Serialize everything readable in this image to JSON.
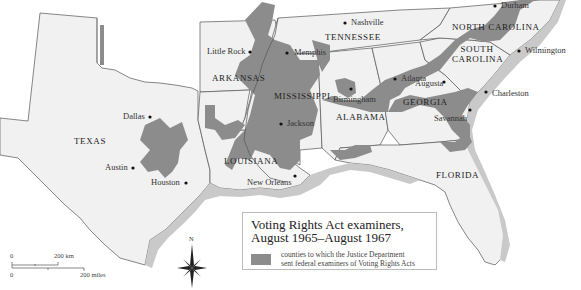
{
  "map": {
    "title": "Voting Rights Act examiners, August 1965–August 1967",
    "states": [
      {
        "name": "TEXAS",
        "x": 87,
        "y": 141
      },
      {
        "name": "ARKANSAS",
        "x": 214,
        "y": 78
      },
      {
        "name": "LOUISIANA",
        "x": 229,
        "y": 161
      },
      {
        "name": "MISSISSIPPI",
        "x": 276,
        "y": 96
      },
      {
        "name": "TENNESSEE",
        "x": 325,
        "y": 37
      },
      {
        "name": "ALABAMA",
        "x": 334,
        "y": 117
      },
      {
        "name": "GEORGIA",
        "x": 402,
        "y": 102
      },
      {
        "name": "SOUTH CAROLINA",
        "x": 451,
        "y": 50
      },
      {
        "name": "NORTH CAROLINA",
        "x": 452,
        "y": 27
      },
      {
        "name": "FLORIDA",
        "x": 436,
        "y": 175
      }
    ],
    "cities": [
      {
        "name": "Dallas",
        "x": 150,
        "y": 117,
        "dot_x": 150,
        "dot_y": 117,
        "label_side": "left"
      },
      {
        "name": "Austin",
        "x": 133,
        "y": 168,
        "dot_x": 133,
        "dot_y": 168,
        "label_side": "left"
      },
      {
        "name": "Houston",
        "x": 186,
        "y": 183,
        "dot_x": 186,
        "dot_y": 183,
        "label_side": "left"
      },
      {
        "name": "Little Rock",
        "x": 250,
        "y": 52,
        "dot_x": 250,
        "dot_y": 52,
        "label_side": "left"
      },
      {
        "name": "Memphis",
        "x": 287,
        "y": 53,
        "dot_x": 287,
        "dot_y": 53,
        "label_side": "right"
      },
      {
        "name": "Nashville",
        "x": 345,
        "y": 23,
        "dot_x": 345,
        "dot_y": 23,
        "label_side": "right"
      },
      {
        "name": "Jackson",
        "x": 281,
        "y": 124,
        "dot_x": 281,
        "dot_y": 124,
        "label_side": "right"
      },
      {
        "name": "New Orleans",
        "x": 295,
        "y": 176,
        "dot_x": 295,
        "dot_y": 176,
        "label_side": "left"
      },
      {
        "name": "Birmingham",
        "x": 351,
        "y": 89,
        "dot_x": 351,
        "dot_y": 89,
        "label_side": "below"
      },
      {
        "name": "Atlanta",
        "x": 395,
        "y": 79,
        "dot_x": 395,
        "dot_y": 79,
        "label_side": "right"
      },
      {
        "name": "Augusta",
        "x": 444,
        "y": 82,
        "dot_x": 444,
        "dot_y": 82,
        "label_side": "left"
      },
      {
        "name": "Charleston",
        "x": 486,
        "y": 92,
        "dot_x": 486,
        "dot_y": 92,
        "label_side": "right"
      },
      {
        "name": "Savannah",
        "x": 470,
        "y": 110,
        "dot_x": 470,
        "dot_y": 110,
        "label_side": "left"
      },
      {
        "name": "Wilmington",
        "x": 519,
        "y": 51,
        "dot_x": 519,
        "dot_y": 51,
        "label_side": "right"
      },
      {
        "name": "Durham",
        "x": 495,
        "y": 6,
        "dot_x": 495,
        "dot_y": 6,
        "label_side": "right"
      }
    ]
  },
  "legend": {
    "title_line1": "Voting Rights Act examiners,",
    "title_line2": "August 1965–August 1967",
    "swatch_color": "#8c8c8c",
    "desc_line1": "counties to which the Justice Department",
    "desc_line2": "sent federal examiners of Voting Rights Acts"
  },
  "scale": {
    "km_zero": "0",
    "km_label": "200 km",
    "mi_zero": "0",
    "mi_label": "200 miles"
  },
  "compass": {
    "north_label": "N"
  },
  "colors": {
    "land": "#f1f1f1",
    "shaded_counties": "#8c8c8c",
    "coastal": "#c9c9c9",
    "border": "#555555"
  }
}
